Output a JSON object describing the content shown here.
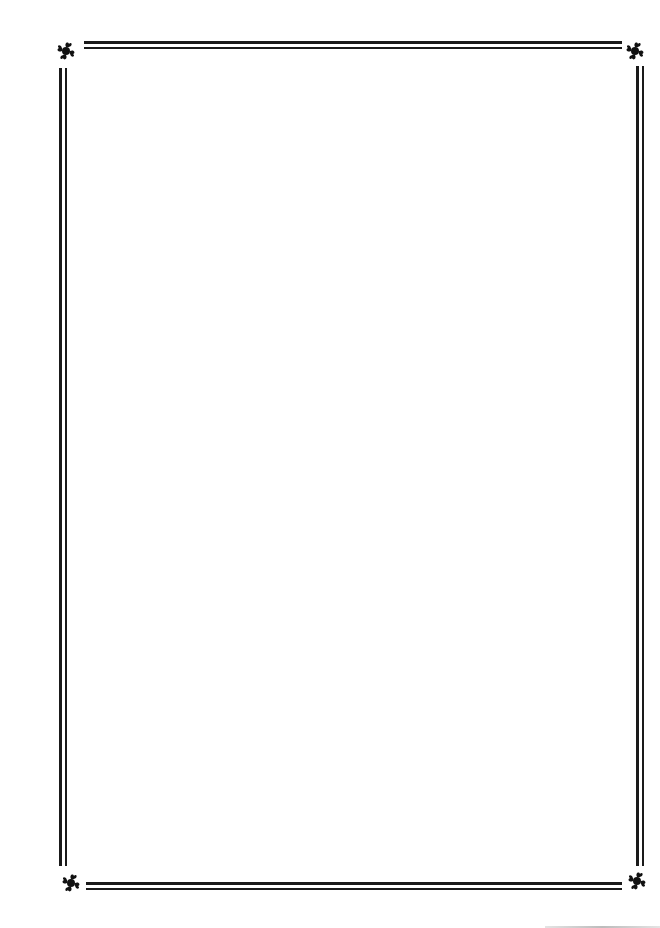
{
  "document": {
    "type": "blank bordered page",
    "border": {
      "style": "double-rule",
      "color": "#1a1a1a",
      "corner_ornament": "fleuron-icon"
    },
    "body_text": ""
  }
}
